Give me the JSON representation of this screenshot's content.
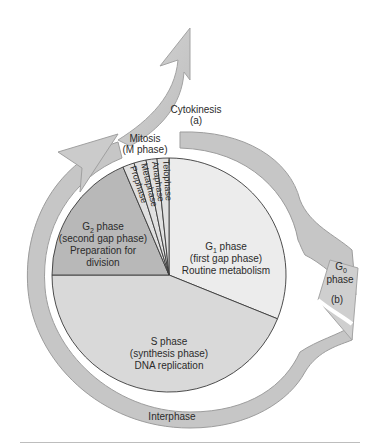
{
  "diagram": {
    "type": "cell-cycle",
    "labels": {
      "cytokinesis": "Cytokinesis",
      "cytokinesis_tag": "(a)",
      "mitosis": "Mitosis",
      "mitosis_sub": "(M phase)",
      "prophase": "Prophase",
      "metaphase": "Metaphase",
      "anaphase": "Anaphase",
      "telophase": "Telophase",
      "g2_title": "G",
      "g2_sub": "2",
      "g2_title_rest": " phase",
      "g2_line2": "(second gap phase)",
      "g2_line3": "Preparation for",
      "g2_line4": "division",
      "g1_title": "G",
      "g1_sub": "1",
      "g1_title_rest": " phase",
      "g1_line2": "(first gap phase)",
      "g1_line3": "Routine metabolism",
      "s_line1": "S phase",
      "s_line2": "(synthesis phase)",
      "s_line3": "DNA replication",
      "g0_title": "G",
      "g0_sub": "0",
      "g0_line2": "phase",
      "g0_tag": "(b)",
      "interphase": "Interphase"
    },
    "colors": {
      "arrow": "#c9c9c9",
      "arrow_shadow": "#9a9a9a",
      "g1": "#ececec",
      "s": "#d9d9d9",
      "g2": "#b7b7b7",
      "mitosis": "#e2e2e2",
      "outline": "#3a3a3a"
    }
  }
}
